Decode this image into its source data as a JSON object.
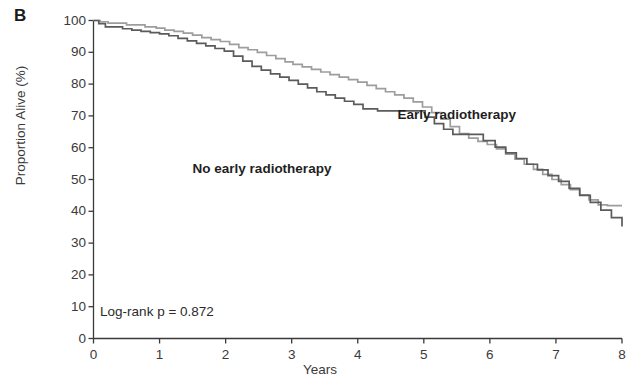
{
  "panel": {
    "label": "B"
  },
  "axes": {
    "ylabel": "Proportion Alive (%)",
    "xlabel": "Years",
    "yticks": [
      "0",
      "10",
      "20",
      "30",
      "40",
      "50",
      "60",
      "70",
      "80",
      "90",
      "100"
    ],
    "xticks": [
      "0",
      "1",
      "2",
      "3",
      "4",
      "5",
      "6",
      "7",
      "8"
    ]
  },
  "annotations": {
    "logrank": "Log-rank p = 0.872",
    "series_early": "Early radiotherapy",
    "series_noearly": "No early radiotherapy"
  },
  "colors": {
    "early": "#9d9d9d",
    "no_early": "#5b5b5b",
    "axis": "#3a3a3a",
    "text": "#2b2b2b",
    "background": "#ffffff"
  },
  "chart_data": {
    "type": "line",
    "title": "",
    "subtitle": "",
    "xlabel": "Years",
    "ylabel": "Proportion Alive (%)",
    "xlim": [
      0,
      8
    ],
    "ylim": [
      0,
      100
    ],
    "xticks": [
      0,
      1,
      2,
      3,
      4,
      5,
      6,
      7,
      8
    ],
    "yticks": [
      0,
      10,
      20,
      30,
      40,
      50,
      60,
      70,
      80,
      90,
      100
    ],
    "grid": false,
    "legend_position": "inline-annotation",
    "step_style": "post",
    "annotations": [
      {
        "text": "Log-rank p = 0.872",
        "x": 0.1,
        "y": 8
      },
      {
        "text": "Early radiotherapy",
        "x": 4.6,
        "y": 70
      },
      {
        "text": "No early radiotherapy",
        "x": 1.5,
        "y": 53
      }
    ],
    "series": [
      {
        "name": "Early radiotherapy",
        "color": "#9d9d9d",
        "x": [
          0.0,
          0.1,
          0.22,
          0.35,
          0.5,
          0.62,
          0.78,
          0.95,
          1.08,
          1.22,
          1.36,
          1.5,
          1.64,
          1.78,
          1.92,
          2.06,
          2.2,
          2.34,
          2.48,
          2.62,
          2.76,
          2.9,
          3.02,
          3.16,
          3.3,
          3.44,
          3.58,
          3.72,
          3.86,
          4.0,
          4.14,
          4.28,
          4.42,
          4.56,
          4.7,
          4.84,
          4.98,
          5.12,
          5.26,
          5.4,
          5.54,
          5.68,
          5.82,
          5.96,
          6.1,
          6.24,
          6.38,
          6.52,
          6.66,
          6.8,
          6.94,
          7.08,
          7.22,
          7.36,
          7.5,
          7.64,
          7.78,
          8.0
        ],
        "y": [
          100.0,
          99.6,
          99.2,
          99.2,
          98.6,
          98.6,
          98.0,
          97.6,
          97.0,
          96.6,
          96.0,
          95.4,
          94.6,
          94.0,
          93.4,
          92.5,
          91.5,
          90.8,
          90.0,
          89.0,
          88.0,
          87.0,
          86.2,
          85.4,
          84.6,
          83.8,
          83.0,
          82.2,
          81.4,
          80.6,
          79.6,
          78.6,
          77.6,
          76.6,
          75.6,
          74.4,
          72.8,
          71.0,
          69.0,
          66.6,
          64.4,
          63.0,
          62.0,
          61.0,
          59.6,
          58.0,
          56.4,
          54.8,
          53.2,
          51.6,
          50.0,
          48.4,
          46.8,
          45.2,
          43.6,
          42.0,
          41.8,
          41.8
        ]
      },
      {
        "name": "No early radiotherapy",
        "color": "#5b5b5b",
        "x": [
          0.0,
          0.08,
          0.18,
          0.3,
          0.44,
          0.58,
          0.72,
          0.86,
          1.0,
          1.14,
          1.28,
          1.42,
          1.56,
          1.7,
          1.84,
          1.98,
          2.12,
          2.26,
          2.4,
          2.54,
          2.68,
          2.82,
          2.96,
          3.1,
          3.24,
          3.38,
          3.52,
          3.66,
          3.8,
          3.94,
          4.08,
          4.3,
          4.56,
          4.82,
          5.02,
          5.16,
          5.3,
          5.44,
          5.58,
          5.72,
          5.9,
          6.08,
          6.24,
          6.4,
          6.56,
          6.72,
          6.88,
          7.04,
          7.2,
          7.36,
          7.52,
          7.68,
          7.84,
          8.0
        ],
        "y": [
          100.0,
          99.0,
          98.0,
          98.0,
          97.4,
          97.0,
          96.6,
          96.2,
          95.8,
          95.2,
          94.4,
          93.6,
          92.8,
          92.0,
          91.2,
          90.4,
          88.8,
          87.2,
          85.6,
          84.4,
          83.2,
          82.2,
          81.2,
          80.0,
          78.8,
          77.6,
          76.6,
          75.6,
          74.6,
          73.6,
          72.2,
          71.6,
          71.6,
          71.6,
          69.6,
          67.6,
          65.8,
          64.2,
          64.2,
          64.2,
          62.2,
          60.2,
          58.4,
          56.6,
          54.8,
          53.0,
          51.2,
          49.4,
          47.2,
          45.0,
          42.8,
          40.4,
          38.0,
          35.2
        ]
      }
    ]
  }
}
